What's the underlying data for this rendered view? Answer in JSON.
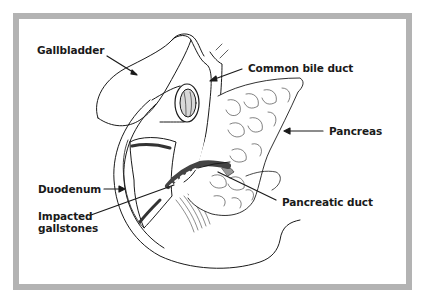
{
  "diagram": {
    "type": "anatomical-illustration",
    "colors": {
      "frame": "#b3b3b3",
      "ink": "#1a1a1a",
      "background": "#ffffff"
    },
    "labels": {
      "gallbladder": "Gallbladder",
      "common_bile_duct": "Common bile duct",
      "pancreas": "Pancreas",
      "duodenum": "Duodenum",
      "impacted_gallstones_line1": "Impacted",
      "impacted_gallstones_line2": "gallstones",
      "pancreatic_duct": "Pancreatic duct"
    }
  }
}
